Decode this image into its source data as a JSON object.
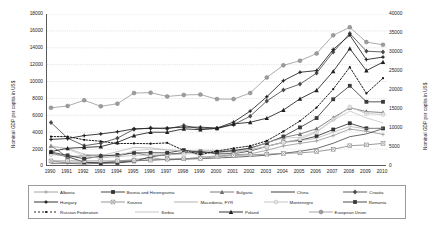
{
  "chart_data": {
    "type": "line",
    "title": "",
    "xlabel": "",
    "ylabel": "Nominal GDP per capita in US$",
    "y2label": "Nominal GDP per capita in US$",
    "ylim": [
      0,
      18000
    ],
    "y2lim": [
      0,
      40000
    ],
    "grid": true,
    "legend_position": "bottom",
    "x": [
      1990,
      1991,
      1992,
      1993,
      1994,
      1995,
      1996,
      1997,
      1998,
      1999,
      2000,
      2001,
      2002,
      2003,
      2004,
      2005,
      2006,
      2007,
      2008,
      2009,
      2010
    ],
    "yticks": [
      0,
      2000,
      4000,
      6000,
      8000,
      10000,
      12000,
      14000,
      16000,
      18000
    ],
    "y2ticks": [
      0,
      5000,
      10000,
      15000,
      20000,
      25000,
      30000,
      35000,
      40000
    ],
    "xticklabels": [
      "1990",
      "1991",
      "1992",
      "1993",
      "1994",
      "1995",
      "1996",
      "1997",
      "1998",
      "1999",
      "2000",
      "2001",
      "2002",
      "2003",
      "2004",
      "2005",
      "2006",
      "2007",
      "2008",
      "2009",
      "2010"
    ],
    "series": [
      {
        "name": "Albania",
        "axis": "left",
        "color": "#9a9a9a",
        "marker": "plus",
        "dash": "none",
        "values": [
          640,
          330,
          200,
          370,
          600,
          750,
          1010,
          700,
          830,
          1060,
          1180,
          1320,
          1430,
          1860,
          2370,
          2680,
          2970,
          3600,
          4370,
          4110,
          3740
        ]
      },
      {
        "name": "Bosnia and Herzegovina",
        "axis": "left",
        "color": "#333333",
        "marker": "square",
        "dash": "none",
        "values": [
          1500,
          1100,
          450,
          330,
          360,
          550,
          1080,
          1400,
          1540,
          1730,
          1430,
          1460,
          1780,
          2320,
          2820,
          3050,
          3530,
          4320,
          5060,
          4460,
          4450
        ]
      },
      {
        "name": "Bulgaria",
        "axis": "left",
        "color": "#6e6e6e",
        "marker": "triangle",
        "dash": "none",
        "values": [
          2400,
          1050,
          1230,
          1310,
          1200,
          1580,
          1190,
          1270,
          1600,
          1640,
          1620,
          1810,
          2100,
          2760,
          3370,
          3790,
          4420,
          5710,
          6900,
          6440,
          6330
        ]
      },
      {
        "name": "China",
        "axis": "left",
        "color": "#2b2b2b",
        "marker": "none",
        "dash": "none",
        "values": [
          320,
          340,
          370,
          380,
          470,
          610,
          700,
          770,
          820,
          870,
          950,
          1040,
          1140,
          1280,
          1500,
          1740,
          2070,
          2690,
          3470,
          3800,
          4430
        ]
      },
      {
        "name": "Croatia",
        "axis": "left",
        "color": "#4a4a4a",
        "marker": "diamond",
        "dash": "none",
        "values": [
          5150,
          3300,
          2400,
          2700,
          3300,
          4350,
          4500,
          4400,
          4800,
          4400,
          4450,
          4900,
          5900,
          7700,
          9000,
          9700,
          11000,
          13500,
          15700,
          13600,
          13500
        ]
      },
      {
        "name": "Hungary",
        "axis": "left",
        "color": "#1f1f1f",
        "marker": "plus-bold",
        "dash": "none",
        "values": [
          3150,
          3250,
          3600,
          3800,
          4050,
          4400,
          4450,
          4500,
          4600,
          4600,
          4500,
          5200,
          6500,
          8200,
          10100,
          11100,
          11300,
          13800,
          15500,
          12600,
          12900
        ]
      },
      {
        "name": "Kosovo",
        "axis": "left",
        "color": "#8a8a8a",
        "marker": "x-box",
        "dash": "none",
        "values": [
          600,
          600,
          600,
          600,
          600,
          640,
          700,
          820,
          850,
          900,
          1100,
          1250,
          1320,
          1400,
          1480,
          1560,
          1700,
          1980,
          2400,
          2500,
          2680
        ]
      },
      {
        "name": "Macedonia, FYR",
        "axis": "left",
        "color": "#aaaaaa",
        "marker": "none",
        "dash": "none",
        "values": [
          2300,
          2100,
          1400,
          1200,
          1700,
          2200,
          2150,
          1900,
          1800,
          1850,
          1860,
          1750,
          1930,
          2340,
          2780,
          3000,
          3290,
          4000,
          4680,
          4400,
          4480
        ]
      },
      {
        "name": "Montenegro",
        "axis": "left",
        "color": "#c0c0c0",
        "marker": "circle-open",
        "dash": "none",
        "values": [
          1350,
          1250,
          1100,
          1000,
          1100,
          1250,
          1300,
          1350,
          1400,
          1550,
          1620,
          1650,
          1880,
          2300,
          2800,
          3200,
          4000,
          5500,
          7000,
          6200,
          6100
        ]
      },
      {
        "name": "Romania",
        "axis": "left",
        "color": "#3a3a3a",
        "marker": "square-bold",
        "dash": "none",
        "values": [
          1650,
          1250,
          860,
          1160,
          1320,
          1560,
          1570,
          1560,
          1880,
          1590,
          1650,
          1820,
          2120,
          2720,
          3490,
          4570,
          5680,
          7900,
          9500,
          7600,
          7600
        ]
      },
      {
        "name": "Russian Federation",
        "axis": "left",
        "color": "#111111",
        "marker": "dot",
        "dash": "dotted",
        "values": [
          3480,
          3490,
          3100,
          2930,
          2660,
          2670,
          2640,
          2740,
          1840,
          1330,
          1780,
          2100,
          2380,
          2980,
          4100,
          5330,
          6920,
          9100,
          11700,
          8600,
          10400
        ]
      },
      {
        "name": "Serbia",
        "axis": "left",
        "color": "#bdbdbd",
        "marker": "none",
        "dash": "none",
        "values": [
          2400,
          2000,
          1200,
          900,
          1200,
          1800,
          2000,
          1900,
          1800,
          1200,
          900,
          1400,
          2000,
          2800,
          3300,
          3400,
          4100,
          5400,
          6500,
          5700,
          5100
        ]
      },
      {
        "name": "Poland",
        "axis": "left",
        "color": "#202020",
        "marker": "triangle-bold",
        "dash": "none",
        "values": [
          1700,
          2100,
          2200,
          2300,
          2800,
          3600,
          4000,
          4000,
          4400,
          4300,
          4450,
          4980,
          5180,
          5660,
          6620,
          7960,
          8960,
          11200,
          13900,
          11300,
          12300
        ]
      },
      {
        "name": "European Union",
        "axis": "right",
        "color": "#9d9d9d",
        "marker": "circle-gray",
        "dash": "none",
        "values": [
          15300,
          15800,
          17300,
          15700,
          16400,
          19200,
          19300,
          18300,
          18700,
          18800,
          17600,
          17600,
          19200,
          23300,
          26500,
          27700,
          29600,
          34400,
          36500,
          32600,
          31900
        ]
      }
    ]
  },
  "legend": {
    "rows": [
      [
        {
          "name": "Albania",
          "swatch": "line-plus-gray"
        },
        {
          "name": "Bosnia and Herzegovina",
          "swatch": "line-square-dark"
        },
        {
          "name": "Bulgaria",
          "swatch": "line-triangle-gray"
        },
        {
          "name": "China",
          "swatch": "line-plain-dark"
        },
        {
          "name": "Croatia",
          "swatch": "line-diamond-dark"
        }
      ],
      [
        {
          "name": "Hungary",
          "swatch": "line-plusbold-dark"
        },
        {
          "name": "Kosovo",
          "swatch": "line-xbox-gray"
        },
        {
          "name": "Macedonia, FYR",
          "swatch": "line-plain-lightgray"
        },
        {
          "name": "Montenegro",
          "swatch": "line-circleopen-lightgray"
        },
        {
          "name": "Romania",
          "swatch": "line-squarebold-dark"
        }
      ],
      [
        {
          "name": "Russian Federation",
          "swatch": "dotted-dot-black"
        },
        {
          "name": "Serbia",
          "swatch": "line-plain-verylightgray"
        },
        {
          "name": "Poland",
          "swatch": "line-trianglebold-dark"
        },
        {
          "name": "European Union",
          "swatch": "line-circlegray"
        }
      ]
    ]
  },
  "colors": {
    "axis": "#5a5a5a",
    "grid": "#b9b9b9",
    "text": "#222222",
    "background": "#ffffff"
  }
}
